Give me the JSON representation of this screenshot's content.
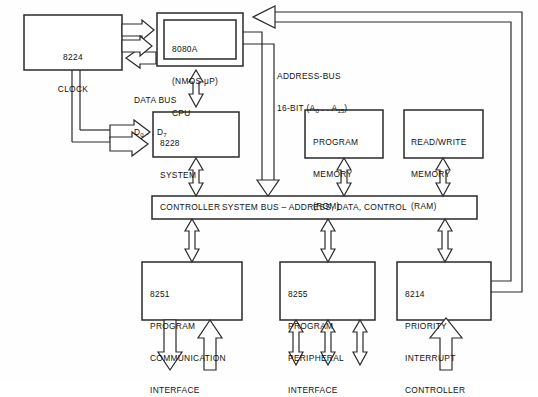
{
  "diagram": {
    "line_color": "#2a2a2a",
    "fill_color": "#ffffff",
    "text_color": "#111111"
  },
  "blocks": {
    "clock": {
      "id": "8224",
      "lines": [
        "8224",
        "CLOCK"
      ]
    },
    "cpu": {
      "id": "8080A",
      "lines": [
        "8080A",
        "(NMOS μP)",
        "CPU"
      ]
    },
    "controller": {
      "id": "8228",
      "lines": [
        "8228",
        "SYSTEM",
        "CONTROLLER"
      ]
    },
    "rom": {
      "id": "ROM",
      "lines": [
        "PROGRAM",
        "MEMORY",
        "(ROM)"
      ]
    },
    "ram": {
      "id": "RAM",
      "lines": [
        "READ/WRITE",
        "MEMORY",
        "(RAM)"
      ]
    },
    "usart": {
      "id": "8251",
      "lines": [
        "8251",
        "PROGRAM",
        "COMMUNICATION",
        "INTERFACE"
      ]
    },
    "ppi": {
      "id": "8255",
      "lines": [
        "8255",
        "PROGRAM",
        "PERIPHERAL",
        "INTERFACE"
      ]
    },
    "interrupt": {
      "id": "8214",
      "lines": [
        "8214",
        "PRIORITY",
        "INTERRUPT",
        "CONTROLLER"
      ]
    },
    "system_bus": {
      "label": "SYSTEM BUS – ADDRESS, DATA, CONTROL"
    }
  },
  "bus_labels": {
    "data_bus": {
      "line1": "DATA BUS",
      "line2_prefix": "D",
      "line2_sub1": "0",
      "line2_mid": " . . D",
      "line2_sub2": "7"
    },
    "address_bus": {
      "line1": "ADDRESS-BUS",
      "line2_prefix": "16-BIT (A",
      "line2_sub1": "0",
      "line2_mid": " . . A",
      "line2_sub2": "15",
      "line2_suffix": ")"
    }
  }
}
